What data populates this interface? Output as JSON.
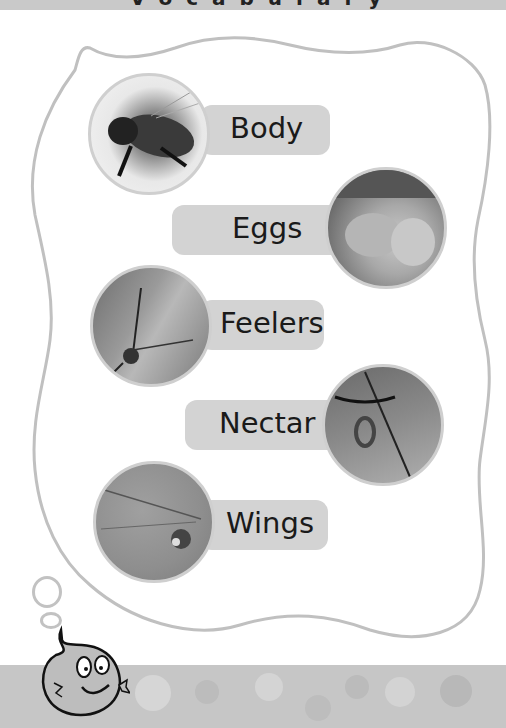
{
  "header": {
    "title": "Vocabulary"
  },
  "colors": {
    "band": "#c9c9c9",
    "pill": "#d3d3d3",
    "outline": "#c0c0c0",
    "text": "#1a1a1a"
  },
  "items": [
    {
      "label": "Body",
      "image": "bee-photo"
    },
    {
      "label": "Eggs",
      "image": "eggs-photo"
    },
    {
      "label": "Feelers",
      "image": "feelers-photo"
    },
    {
      "label": "Nectar",
      "image": "nectar-photo"
    },
    {
      "label": "Wings",
      "image": "wings-photo"
    }
  ],
  "mascot": {
    "name": "smiling-blob-mascot"
  }
}
